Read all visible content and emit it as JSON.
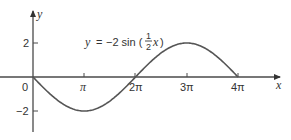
{
  "chart_data": {
    "type": "line",
    "title": "",
    "equation": {
      "lhs": "y",
      "equals": "=",
      "rhs_prefix": "−2 sin (",
      "frac_num": "1",
      "frac_den": "2",
      "rhs_var": "x",
      "rhs_suffix": ")"
    },
    "xlabel": "x",
    "ylabel": "y",
    "x_ticks": [
      "0",
      "π",
      "2π",
      "3π",
      "4π"
    ],
    "x_tick_values": [
      0,
      3.14159,
      6.28319,
      9.42478,
      12.56637
    ],
    "y_ticks": [
      "2",
      "−2"
    ],
    "y_tick_values": [
      2,
      -2
    ],
    "xlim": [
      0,
      14.5
    ],
    "ylim": [
      -3.2,
      3.8
    ],
    "grid": false,
    "series": [
      {
        "name": "y = -2 sin(x/2)",
        "x": [
          0,
          1.5708,
          3.14159,
          4.7124,
          6.28319,
          7.85398,
          9.42478,
          10.9956,
          12.56637
        ],
        "y": [
          0,
          -1.414,
          -2,
          -1.414,
          0,
          1.414,
          2,
          1.414,
          0
        ]
      }
    ]
  }
}
